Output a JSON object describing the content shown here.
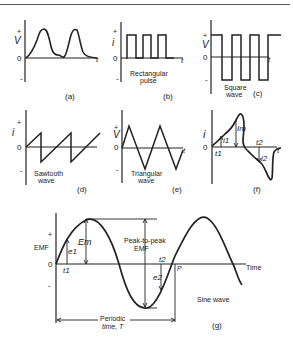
{
  "panels": {
    "a": {
      "caption": "(a)",
      "y_axis": "V",
      "plus": "+",
      "zero": "0",
      "minus": "-",
      "x_axis": "t",
      "name": ""
    },
    "b": {
      "caption": "(b)",
      "y_axis": "i",
      "plus": "+",
      "zero": "0",
      "minus": "-",
      "x_axis": "t",
      "name_line1": "Rectangular",
      "name_line2": "pulse"
    },
    "c": {
      "caption": "(c)",
      "y_axis": "V",
      "plus": "+",
      "zero": "0",
      "minus": "-",
      "x_axis": "t",
      "name_line1": "Square",
      "name_line2": "wave"
    },
    "d": {
      "caption": "(d)",
      "y_axis": "i",
      "plus": "+",
      "zero": "0",
      "minus": "-",
      "x_axis": "t",
      "name_line1": "Sawtooth",
      "name_line2": "wave"
    },
    "e": {
      "caption": "(e)",
      "y_axis": "V",
      "plus": "+",
      "zero": "0",
      "minus": "-",
      "x_axis": "t",
      "name_line1": "Triangular",
      "name_line2": "wave"
    },
    "f": {
      "caption": "(f)",
      "y_axis": "i",
      "zero": "0",
      "x_axis": "t",
      "i1": "i1",
      "t1": "t1",
      "im": "Im",
      "t2": "t2",
      "i2": "i2"
    },
    "g": {
      "caption": "(g)",
      "y_axis": "EMF",
      "plus": "+",
      "zero": "0",
      "minus": "-",
      "x_axis": "Time",
      "em": "Em",
      "e1": "e1",
      "t1": "t1",
      "e2": "e2",
      "t2": "t2",
      "p": "P",
      "peak_line1": "Peak-to-peak",
      "peak_line2": "EMF",
      "periodic_line1": "Periodic",
      "periodic_line2": "time, T",
      "name": "Sine wave"
    }
  }
}
